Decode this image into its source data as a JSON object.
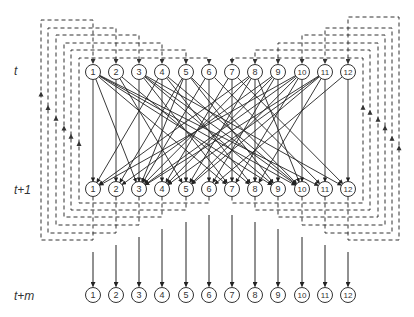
{
  "diagram": {
    "row_labels": [
      {
        "text": "t",
        "x": 14,
        "y": 64
      },
      {
        "text": "t+1",
        "x": 14,
        "y": 183
      },
      {
        "text": "t+m",
        "x": 14,
        "y": 289
      }
    ],
    "nodes": [
      "1",
      "2",
      "3",
      "4",
      "5",
      "6",
      "7",
      "8",
      "9",
      "10",
      "11",
      "12"
    ],
    "node_x": [
      93,
      116,
      139,
      162,
      186,
      209,
      232,
      255,
      278,
      302,
      325,
      348
    ],
    "rows_y": {
      "t": 72,
      "t1": 189,
      "tm": 295
    },
    "node_radius": 7.5,
    "colors": {
      "line": "#222222",
      "dash": "#333333",
      "node_fill": "#ffffff"
    },
    "edges_t_to_t1": [
      [
        1,
        1
      ],
      [
        1,
        3
      ],
      [
        1,
        7
      ],
      [
        1,
        9
      ],
      [
        1,
        10
      ],
      [
        1,
        11
      ],
      [
        2,
        2
      ],
      [
        2,
        5
      ],
      [
        2,
        8
      ],
      [
        3,
        3
      ],
      [
        3,
        7
      ],
      [
        3,
        9
      ],
      [
        3,
        10
      ],
      [
        3,
        12
      ],
      [
        4,
        4
      ],
      [
        4,
        8
      ],
      [
        4,
        10
      ],
      [
        4,
        1
      ],
      [
        5,
        5
      ],
      [
        5,
        9
      ],
      [
        5,
        10
      ],
      [
        5,
        2
      ],
      [
        5,
        3
      ],
      [
        6,
        6
      ],
      [
        6,
        11
      ],
      [
        6,
        3
      ],
      [
        7,
        7
      ],
      [
        7,
        4
      ],
      [
        7,
        12
      ],
      [
        8,
        8
      ],
      [
        8,
        1
      ],
      [
        8,
        3
      ],
      [
        8,
        5
      ],
      [
        8,
        10
      ],
      [
        9,
        9
      ],
      [
        9,
        2
      ],
      [
        9,
        4
      ],
      [
        9,
        6
      ],
      [
        10,
        10
      ],
      [
        10,
        1
      ],
      [
        10,
        3
      ],
      [
        10,
        5
      ],
      [
        10,
        7
      ],
      [
        11,
        11
      ],
      [
        11,
        3
      ],
      [
        11,
        4
      ],
      [
        11,
        5
      ],
      [
        11,
        8
      ],
      [
        12,
        12
      ],
      [
        12,
        6
      ]
    ],
    "loops_left": [
      {
        "node": 1,
        "x": 41,
        "top": 20,
        "bottom": 240
      },
      {
        "node": 2,
        "x": 48,
        "top": 28,
        "bottom": 233
      },
      {
        "node": 3,
        "x": 56,
        "top": 35,
        "bottom": 225
      },
      {
        "node": 4,
        "x": 64,
        "top": 43,
        "bottom": 217
      },
      {
        "node": 5,
        "x": 71,
        "top": 50,
        "bottom": 210
      },
      {
        "node": 6,
        "x": 79,
        "top": 58,
        "bottom": 203
      }
    ],
    "loops_right": [
      {
        "node": 7,
        "x": 363,
        "top": 58,
        "bottom": 203
      },
      {
        "node": 8,
        "x": 370,
        "top": 50,
        "bottom": 210
      },
      {
        "node": 9,
        "x": 378,
        "top": 43,
        "bottom": 217
      },
      {
        "node": 10,
        "x": 385,
        "top": 35,
        "bottom": 225
      },
      {
        "node": 11,
        "x": 392,
        "top": 28,
        "bottom": 233
      },
      {
        "node": 12,
        "x": 399,
        "top": 17,
        "bottom": 240
      }
    ]
  }
}
